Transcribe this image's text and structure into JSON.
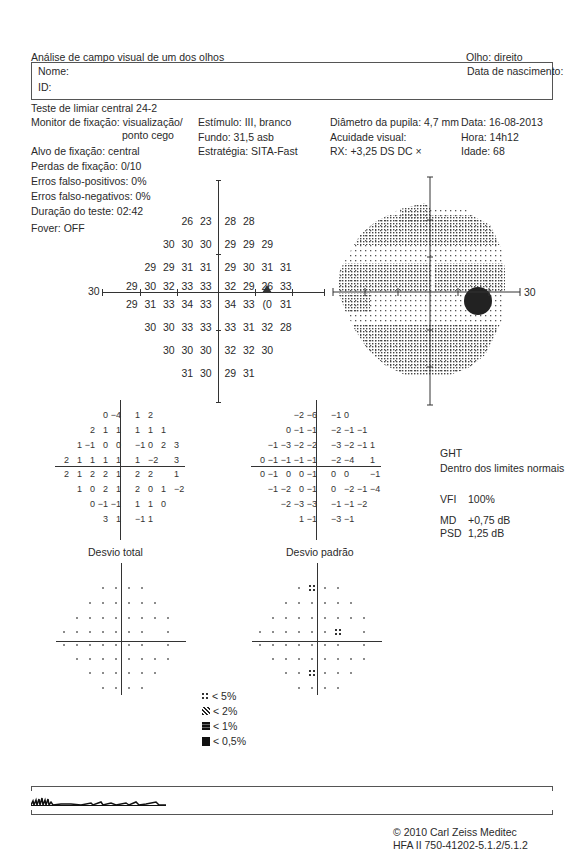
{
  "header": {
    "title": "Análise de campo visual de um dos olhos",
    "eye": "Olho: direito",
    "name_label": "Nome:",
    "id_label": "ID:",
    "dob_label": "Data de nascimento:",
    "test_name": "Teste de limiar central 24-2"
  },
  "test_info": {
    "col1": {
      "fixation_monitor_line1": "Monitor de fixação: visualização/",
      "fixation_monitor_line2": "ponto cego",
      "fixation_target": "Alvo de fixação: central",
      "fixation_losses": "Perdas de fixação: 0/10",
      "false_pos": "Erros falso-positivos: 0%",
      "false_neg": "Erros falso-negativos: 0%",
      "duration": "Duração do teste: 02:42",
      "fovea": "Fover: OFF"
    },
    "col2": {
      "stimulus": "Estímulo: III, branco",
      "background": "Fundo: 31,5 asb",
      "strategy": "Estratégia: SITA-Fast"
    },
    "col3": {
      "pupil": "Diâmetro da pupila: 4,7 mm",
      "acuity": "Acuidade visual:",
      "rx": "RX: +3,25 DS    DC ×"
    },
    "col4": {
      "date": "Data: 16-08-2013",
      "time": "Hora: 14h12",
      "age": "Idade: 68"
    }
  },
  "threshold_plot": {
    "axis_label": "30",
    "rows": [
      [
        null,
        null,
        null,
        "26",
        "23",
        "28",
        "28",
        null,
        null,
        null
      ],
      [
        null,
        null,
        "30",
        "30",
        "30",
        "29",
        "29",
        "29",
        null,
        null
      ],
      [
        null,
        "29",
        "29",
        "31",
        "31",
        "29",
        "30",
        "31",
        "31",
        null
      ],
      [
        "29",
        "30",
        "32",
        "33",
        "33",
        "32",
        "29",
        "26",
        "33",
        null
      ],
      [
        "29",
        "31",
        "33",
        "34",
        "33",
        "34",
        "33",
        "(0",
        "31",
        null
      ],
      [
        null,
        "30",
        "30",
        "33",
        "33",
        "33",
        "31",
        "32",
        "28",
        null
      ],
      [
        null,
        null,
        "30",
        "30",
        "30",
        "32",
        "32",
        "30",
        null,
        null
      ],
      [
        null,
        null,
        null,
        "31",
        "30",
        "29",
        "31",
        null,
        null,
        null
      ]
    ]
  },
  "greyscale_plot": {
    "axis_label": "30"
  },
  "total_deviation": {
    "title": "Desvio total",
    "rows": [
      [
        null,
        null,
        null,
        "0",
        "−4",
        "1",
        "2",
        null,
        null
      ],
      [
        null,
        null,
        "2",
        "1",
        "1",
        "1",
        "1",
        "1",
        null
      ],
      [
        null,
        "1",
        "−1",
        "0",
        "0",
        "−1",
        "0",
        "2",
        "3"
      ],
      [
        "2",
        "1",
        "1",
        "1",
        "1",
        "1",
        "−2",
        null,
        "3"
      ],
      [
        "2",
        "1",
        "2",
        "2",
        "1",
        "2",
        "2",
        null,
        "1"
      ],
      [
        null,
        "1",
        "0",
        "2",
        "1",
        "2",
        "0",
        "1",
        "−2"
      ],
      [
        null,
        null,
        "0",
        "−1",
        "−1",
        "1",
        "1",
        "0",
        null
      ],
      [
        null,
        null,
        null,
        "3",
        "1",
        "−1",
        "1",
        null,
        null
      ]
    ]
  },
  "pattern_deviation": {
    "title": "Desvio padrão",
    "rows": [
      [
        null,
        null,
        null,
        "−2",
        "−6",
        "−1",
        "0",
        null,
        null
      ],
      [
        null,
        null,
        "0",
        "−1",
        "−1",
        "−2",
        "−1",
        "−1",
        null
      ],
      [
        null,
        "−1",
        "−3",
        "−2",
        "−2",
        "−3",
        "−2",
        "−1",
        "1"
      ],
      [
        "0",
        "−1",
        "−1",
        "−1",
        "−1",
        "−2",
        "−4",
        null,
        "1"
      ],
      [
        "0",
        "−1",
        "0",
        "0",
        "−1",
        "0",
        "0",
        null,
        "−1"
      ],
      [
        null,
        "−1",
        "−2",
        "0",
        "−1",
        "0",
        "−2",
        "−1",
        "−4"
      ],
      [
        null,
        null,
        "−2",
        "−3",
        "−3",
        "−1",
        "−1",
        "−2",
        null
      ],
      [
        null,
        null,
        null,
        "1",
        "−1",
        "−3",
        "−1",
        null,
        null
      ]
    ]
  },
  "total_prob": {
    "rows": [
      [
        0,
        0,
        0,
        1,
        1,
        1,
        1,
        0,
        0
      ],
      [
        0,
        0,
        1,
        1,
        1,
        1,
        1,
        1,
        0
      ],
      [
        0,
        1,
        1,
        1,
        1,
        1,
        1,
        1,
        1
      ],
      [
        1,
        1,
        1,
        1,
        1,
        1,
        1,
        0,
        1
      ],
      [
        1,
        1,
        1,
        1,
        1,
        1,
        1,
        0,
        1
      ],
      [
        0,
        1,
        1,
        1,
        1,
        1,
        1,
        1,
        1
      ],
      [
        0,
        0,
        1,
        1,
        1,
        1,
        1,
        1,
        0
      ],
      [
        0,
        0,
        0,
        1,
        1,
        1,
        1,
        0,
        0
      ]
    ]
  },
  "pattern_prob": {
    "rows": [
      [
        0,
        0,
        0,
        1,
        5,
        1,
        1,
        0,
        0
      ],
      [
        0,
        0,
        1,
        1,
        1,
        1,
        1,
        1,
        0
      ],
      [
        0,
        1,
        1,
        1,
        1,
        1,
        1,
        1,
        1
      ],
      [
        1,
        1,
        1,
        1,
        1,
        1,
        5,
        0,
        1
      ],
      [
        1,
        1,
        1,
        1,
        1,
        1,
        1,
        0,
        1
      ],
      [
        0,
        1,
        1,
        1,
        1,
        1,
        1,
        1,
        1
      ],
      [
        0,
        0,
        1,
        1,
        5,
        1,
        1,
        1,
        0
      ],
      [
        0,
        0,
        0,
        1,
        1,
        1,
        1,
        0,
        0
      ]
    ]
  },
  "indices": {
    "ght_label": "GHT",
    "ght_value": "Dentro dos limites normais",
    "vfi_label": "VFI",
    "vfi_value": "100%",
    "md_label": "MD",
    "md_value": "+0,75 dB",
    "psd_label": "PSD",
    "psd_value": "1,25 dB"
  },
  "legend": [
    {
      "symbol": "p5-icon",
      "label": "< 5%"
    },
    {
      "symbol": "p2-icon",
      "label": "< 2%"
    },
    {
      "symbol": "p1-icon",
      "label": "< 1%"
    },
    {
      "symbol": "p05-icon",
      "label": "< 0,5%"
    }
  ],
  "footer": {
    "copyright": "© 2010 Carl Zeiss Meditec",
    "version": "HFA II 750-41202-5.1.2/5.1.2"
  }
}
